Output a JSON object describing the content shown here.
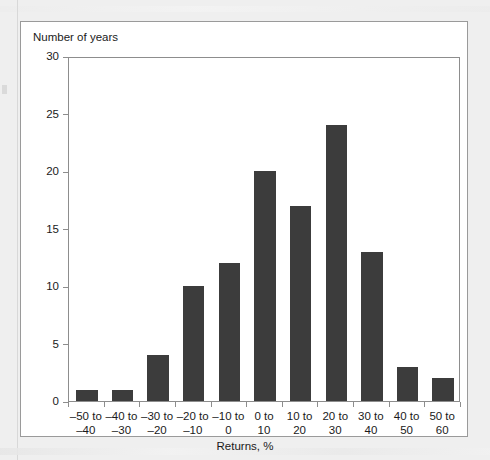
{
  "figure": {
    "y_axis_title": "Number of years",
    "x_axis_title": "Returns, %"
  },
  "colors": {
    "bar": "#3c3c3c",
    "axis": "#8d8d8d",
    "frame": "#9a9a9a",
    "page_background": "#efefef",
    "plot_background": "#ffffff",
    "text": "#1a1a1a"
  },
  "chart_data": {
    "type": "bar",
    "title": "",
    "subtitle": "",
    "xlabel": "Returns, %",
    "ylabel": "Number of years",
    "categories": [
      "-50 to -40",
      "-40 to -30",
      "-30 to -20",
      "-20 to -10",
      "-10 to 0",
      "0 to 10",
      "10 to 20",
      "20 to 30",
      "30 to 40",
      "40 to 50",
      "50 to 60"
    ],
    "category_lines": [
      [
        "–50 to",
        "–40"
      ],
      [
        "–40 to",
        "–30"
      ],
      [
        "–30 to",
        "–20"
      ],
      [
        "–20 to",
        "–10"
      ],
      [
        "–10 to",
        "0"
      ],
      [
        "0 to",
        "10"
      ],
      [
        "10 to",
        "20"
      ],
      [
        "20 to",
        "30"
      ],
      [
        "30 to",
        "40"
      ],
      [
        "40 to",
        "50"
      ],
      [
        "50 to",
        "60"
      ]
    ],
    "values": [
      1,
      1,
      4,
      10,
      12,
      20,
      17,
      24,
      13,
      3,
      2
    ],
    "ylim": [
      0,
      30
    ],
    "yticks": [
      0,
      5,
      10,
      15,
      20,
      25,
      30
    ],
    "ytick_labels": [
      "0",
      "5",
      "10",
      "15",
      "20",
      "25",
      "30"
    ],
    "grid": false,
    "legend": false
  }
}
